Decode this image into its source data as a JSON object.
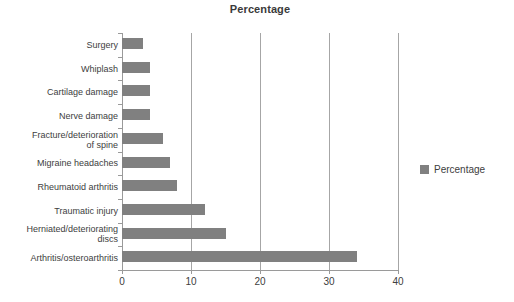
{
  "chart_data": {
    "type": "bar",
    "orientation": "horizontal",
    "title": "Percentage",
    "xlabel": "",
    "ylabel": "",
    "xlim": [
      0,
      40
    ],
    "xticks": [
      0,
      10,
      20,
      30,
      40
    ],
    "grid": "vertical",
    "legend_position": "right",
    "series_name": "Percentage",
    "bar_color": "#808080",
    "categories": [
      "Surgery",
      "Whiplash",
      "Cartilage damage",
      "Nerve damage",
      "Fracture/deterioration\nof spine",
      "Migraine headaches",
      "Rheumatoid arthritis",
      "Traumatic injury",
      "Herniated/deteriorating\ndiscs",
      "Arthritis/osteroarthritis"
    ],
    "values": [
      3,
      4,
      4,
      4,
      6,
      7,
      8,
      12,
      15,
      34
    ]
  },
  "legend": {
    "label": "Percentage"
  },
  "axis": {
    "tick_labels": [
      "0",
      "10",
      "20",
      "30",
      "40"
    ]
  },
  "caption": {
    "text": ""
  }
}
